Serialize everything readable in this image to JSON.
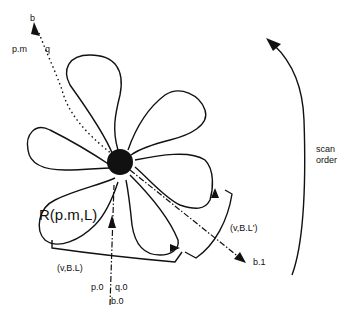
{
  "diagram": {
    "labels": {
      "b_top": "b",
      "pm": "p.m",
      "q": "q",
      "region": "R(p.m,L)",
      "vbl": "(v,B.L)",
      "vbl_prime": "(v,B.L')",
      "p0": "p.0",
      "q0": "q.0",
      "b0": "b.0",
      "b1": "b.1",
      "scan_order_line1": "scan",
      "scan_order_line2": "order"
    },
    "colors": {
      "ink": "#111111",
      "background": "#ffffff"
    },
    "petals": 6
  }
}
